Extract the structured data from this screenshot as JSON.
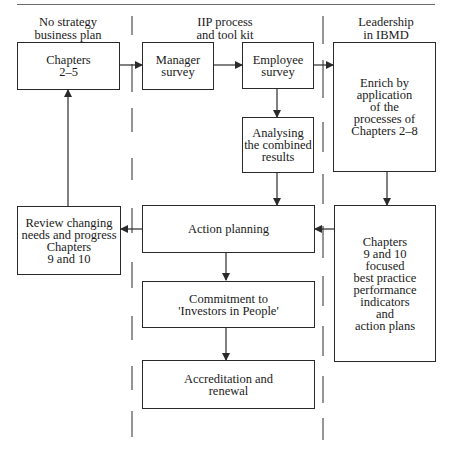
{
  "columns": {
    "left": "No strategy\nbusiness plan",
    "middle": "IIP process\nand tool kit",
    "right": "Leadership\nin IBMD"
  },
  "boxes": {
    "chapters_2_5": "Chapters\n2–5",
    "manager_survey": "Manager\nsurvey",
    "employee_survey": "Employee\nsurvey",
    "enrich": "Enrich by\napplication\nof the\nprocesses of\nChapters 2–8",
    "analysing": "Analysing\nthe combined\nresults",
    "review": "Review changing\nneeds and progress\nChapters\n9 and 10",
    "action_planning": "Action planning",
    "chapters_9_10": "Chapters\n9 and 10\nfocused\nbest practice\nperformance\nindicators\nand\naction plans",
    "commitment": "Commitment to\n'Investors in People'",
    "accreditation": "Accreditation and\nrenewal"
  },
  "flows": [
    {
      "from": "Chapters 2–5",
      "to": "Manager survey"
    },
    {
      "from": "Manager survey",
      "to": "Employee survey"
    },
    {
      "from": "Employee survey",
      "to": "Enrich by application of the processes of Chapters 2–8"
    },
    {
      "from": "Employee survey",
      "to": "Analysing the combined results"
    },
    {
      "from": "Analysing the combined results",
      "to": "Action planning"
    },
    {
      "from": "Enrich by application of the processes of Chapters 2–8",
      "to": "Chapters 9 and 10 focused best practice performance indicators and action plans"
    },
    {
      "from": "Chapters 9 and 10 focused best practice performance indicators and action plans",
      "to": "Action planning"
    },
    {
      "from": "Action planning",
      "to": "Review changing needs and progress Chapters 9 and 10"
    },
    {
      "from": "Review changing needs and progress Chapters 9 and 10",
      "to": "Chapters 2–5"
    },
    {
      "from": "Action planning",
      "to": "Commitment to 'Investors in People'"
    },
    {
      "from": "Commitment to 'Investors in People'",
      "to": "Accreditation and renewal"
    }
  ],
  "colors": {
    "line": "#2a2a2a",
    "rule": "#6a6a6a",
    "background": "#ffffff"
  }
}
